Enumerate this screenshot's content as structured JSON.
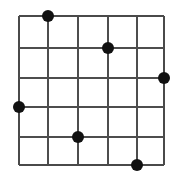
{
  "figure": {
    "title": "Grid with marked intersection points",
    "background_color": "#ffffff",
    "width": 180,
    "height": 179
  },
  "chart_data": {
    "type": "scatter",
    "title": "",
    "subtitle": "",
    "xlabel": "",
    "ylabel": "",
    "grid": true,
    "legend": null,
    "legend_position": "none",
    "xlim": [
      0,
      5
    ],
    "ylim": [
      0,
      5
    ],
    "xticks": [
      0,
      1,
      2,
      3,
      4,
      5
    ],
    "yticks": [
      0,
      1,
      2,
      3,
      4,
      5
    ],
    "xtick_labels": [
      "",
      "",
      "",
      "",
      "",
      ""
    ],
    "ytick_labels": [
      "",
      "",
      "",
      "",
      "",
      ""
    ],
    "grid_columns": 5,
    "grid_rows": 5,
    "x_gridline_positions": [
      19,
      48,
      78,
      108,
      137,
      164
    ],
    "y_gridline_positions": [
      16,
      48,
      78,
      107,
      137,
      165
    ],
    "grid_line_color": "#4d4d4d",
    "grid_line_width": 1.6,
    "marker_color": "#111111",
    "marker_shape": "circle",
    "marker_radius": 6,
    "point_count": 6,
    "points": [
      {
        "col": 1,
        "row": 0,
        "x": 48,
        "y": 16,
        "label": "point-1"
      },
      {
        "col": 3,
        "row": 1,
        "x": 108,
        "y": 48,
        "label": "point-2"
      },
      {
        "col": 5,
        "row": 2,
        "x": 164,
        "y": 78,
        "label": "point-3"
      },
      {
        "col": 0,
        "row": 3,
        "x": 19,
        "y": 107,
        "label": "point-4"
      },
      {
        "col": 2,
        "row": 4,
        "x": 78,
        "y": 137,
        "label": "point-5"
      },
      {
        "col": 4,
        "row": 5,
        "x": 137,
        "y": 165,
        "label": "point-6"
      }
    ]
  }
}
